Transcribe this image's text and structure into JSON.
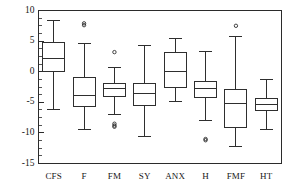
{
  "chart_data": {
    "type": "box",
    "title": "",
    "subtitle": "",
    "xlabel": "",
    "ylabel": "",
    "categories": [
      "CFS",
      "F",
      "FM",
      "SY",
      "ANX",
      "H",
      "FMF",
      "HT"
    ],
    "ylim": [
      -15,
      10
    ],
    "ytick_labels": [
      "10",
      "5",
      "0",
      "-5",
      "-10",
      "-15"
    ],
    "ytick_values": [
      10,
      5,
      0,
      -5,
      -10,
      -15
    ],
    "yminor_step": 1.25,
    "grid": false,
    "legend": null,
    "frame": "box",
    "boxes": [
      {
        "category": "CFS",
        "whisker_low": -6.1,
        "q1": 0.0,
        "median": 2.2,
        "q3": 4.8,
        "whisker_high": 8.4,
        "outliers": []
      },
      {
        "category": "F",
        "whisker_low": -9.4,
        "q1": -5.7,
        "median": -3.9,
        "q3": -1.0,
        "whisker_high": 4.6,
        "outliers": [
          7.6,
          7.9
        ]
      },
      {
        "category": "FM",
        "whisker_low": -7.0,
        "q1": -4.1,
        "median": -2.8,
        "q3": -1.9,
        "whisker_high": 0.7,
        "outliers": [
          3.2,
          -8.5,
          -8.8,
          -9.0
        ]
      },
      {
        "category": "SY",
        "whisker_low": -10.6,
        "q1": -5.6,
        "median": -3.6,
        "q3": -1.9,
        "whisker_high": 4.3,
        "outliers": []
      },
      {
        "category": "ANX",
        "whisker_low": -4.9,
        "q1": -2.6,
        "median": 0.0,
        "q3": 3.2,
        "whisker_high": 5.5,
        "outliers": []
      },
      {
        "category": "H",
        "whisker_low": -7.9,
        "q1": -4.2,
        "median": -2.7,
        "q3": -1.6,
        "whisker_high": 3.3,
        "outliers": [
          -11.2,
          -11.0
        ]
      },
      {
        "category": "FMF",
        "whisker_low": -12.3,
        "q1": -9.1,
        "median": -5.2,
        "q3": -2.9,
        "whisker_high": 5.8,
        "outliers": [
          7.5
        ]
      },
      {
        "category": "HT",
        "whisker_low": -9.5,
        "q1": -6.4,
        "median": -5.4,
        "q3": -4.4,
        "whisker_high": -1.3,
        "outliers": []
      }
    ]
  },
  "colors": {
    "line": "#2e2e2e",
    "axis": "#2b2b2b",
    "box_fill": "#ffffff",
    "background": "#ffffff",
    "text": "#161616"
  }
}
